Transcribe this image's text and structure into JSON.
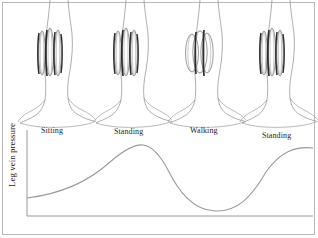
{
  "figure": {
    "border_color": "#b9b9b9",
    "background": "#ffffff"
  },
  "axes": {
    "y_label": "Leg vein pressure",
    "axis_color": "#9a9a9a",
    "origin_x": 27,
    "origin_y": 216,
    "y_top": 130,
    "x_right": 313
  },
  "phase_labels": [
    {
      "text": "Sitting",
      "x": 41,
      "y": 126
    },
    {
      "text": "Standing",
      "x": 114,
      "y": 127
    },
    {
      "text": "Walking",
      "x": 190,
      "y": 126
    },
    {
      "text": "Standing",
      "x": 262,
      "y": 131
    }
  ],
  "legs": [
    {
      "name": "leg-sitting",
      "x": 28,
      "vein_style": "elongated"
    },
    {
      "name": "leg-standing-1",
      "x": 104,
      "vein_style": "elongated"
    },
    {
      "name": "leg-walking",
      "x": 178,
      "vein_style": "compressed"
    },
    {
      "name": "leg-standing-2",
      "x": 250,
      "vein_style": "elongated"
    }
  ],
  "colors": {
    "outline": "#8c8c8c",
    "vein_dark": "#2b2b2b",
    "vein_mid": "#6f6f6f",
    "vein_light": "#a5a5a5",
    "curve": "#9a9a9a",
    "text": "#1d1d1d"
  },
  "chart_data": {
    "type": "line",
    "title": "Leg vein pressure",
    "xlabel": "",
    "ylabel": "Leg vein pressure",
    "grid": false,
    "legend": "none",
    "x_categories": [
      "Sitting",
      "Standing",
      "Walking",
      "Standing"
    ],
    "xlim": [
      0,
      100
    ],
    "ylim": [
      0,
      100
    ],
    "annotations": [
      "Pressure low and slowly rising while sitting",
      "Pressure peaks while standing still",
      "Calf muscle pump lowers pressure during walking",
      "Pressure rises again on standing still"
    ],
    "series": [
      {
        "name": "Leg vein pressure",
        "x": [
          0,
          8,
          16,
          24,
          32,
          40,
          48,
          56,
          64,
          72,
          80,
          88,
          96,
          100
        ],
        "values": [
          21,
          22,
          25,
          30,
          38,
          50,
          66,
          79,
          80,
          64,
          36,
          14,
          8,
          9
        ]
      }
    ],
    "points": [
      {
        "label": "start-sitting",
        "x": 0,
        "y": 21
      },
      {
        "label": "rise-to-standing",
        "x": 40,
        "y": 50
      },
      {
        "label": "standing-peak",
        "x": 60,
        "y": 80
      },
      {
        "label": "walking-trough",
        "x": 93,
        "y": 8
      },
      {
        "label": "standing-plateau",
        "x": 100,
        "y": 9
      }
    ],
    "curve_pixel_path": "M27,198 C60,194 88,182 110,162 C124,150 134,144 143,145 C152,146 160,155 168,170 C178,190 192,210 215,211 C238,212 252,196 266,172 C280,152 295,146 313,148"
  }
}
